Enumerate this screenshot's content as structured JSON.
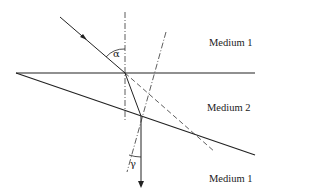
{
  "diagram": {
    "type": "optics-refraction-through-wedge-prism",
    "labels": {
      "medium_top": "Medium 1",
      "medium_middle": "Medium 2",
      "medium_bottom": "Medium 1",
      "angle_incident": "α",
      "angle_exit": "γ"
    },
    "colors": {
      "line": "#222222",
      "background": "#ffffff"
    },
    "geometry": {
      "interface_top": {
        "x1": 16,
        "y1": 73,
        "x2": 255,
        "y2": 73
      },
      "interface_wedge": {
        "x1": 16,
        "y1": 73,
        "x2": 255,
        "y2": 155
      },
      "incident_ray": {
        "x1": 60,
        "y1": 17,
        "x2": 125,
        "y2": 73
      },
      "normal_top": {
        "x1": 125,
        "y1": 12,
        "x2": 125,
        "y2": 120
      },
      "refracted_ray": {
        "x1": 125,
        "y1": 73,
        "x2": 141,
        "y2": 116
      },
      "extended_incident_dashed": {
        "x1": 125,
        "y1": 73,
        "x2": 215,
        "y2": 152
      },
      "normal_wedge": {
        "x1": 166,
        "y1": 32,
        "x2": 127,
        "y2": 172
      },
      "exit_ray": {
        "x1": 141,
        "y1": 116,
        "x2": 141,
        "y2": 186
      }
    }
  }
}
